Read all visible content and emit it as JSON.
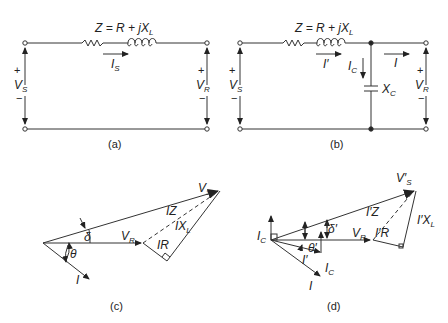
{
  "figure": {
    "panels": [
      {
        "id": "a",
        "caption": "(a)",
        "type": "circuit",
        "impedance_label": "Z = R + jX",
        "impedance_sub": "L",
        "current_label": "I",
        "current_sub": "S",
        "vs_label": "V",
        "vs_sub": "S",
        "vr_label": "V",
        "vr_sub": "R",
        "plus": "+",
        "minus": "−"
      },
      {
        "id": "b",
        "caption": "(b)",
        "type": "circuit",
        "impedance_label": "Z = R + jX",
        "impedance_sub": "L",
        "current_label": "I′",
        "cap_current_label": "I",
        "cap_current_sub": "C",
        "load_current_label": "I",
        "capacitor_label": "X",
        "capacitor_sub": "C",
        "vs_label": "V",
        "vs_sub": "S",
        "vr_label": "V",
        "vr_sub": "R",
        "plus": "+",
        "minus": "−"
      },
      {
        "id": "c",
        "caption": "(c)",
        "type": "phasor",
        "labels": {
          "vs": "V",
          "vs_sub": "S",
          "vr": "V",
          "vr_sub": "R",
          "iz": "IZ",
          "ixl": "IX",
          "ixl_sub": "L",
          "ir": "IR",
          "i": "I",
          "delta": "δ",
          "theta": "θ"
        }
      },
      {
        "id": "d",
        "caption": "(d)",
        "type": "phasor",
        "labels": {
          "vs": "V′",
          "vs_sub": "S",
          "vr": "V",
          "vr_sub": "R",
          "iz": "I′Z",
          "ixl": "I′X",
          "ixl_sub": "L",
          "ir": "I′R",
          "ic_top": "I",
          "ic_top_sub": "C",
          "ic": "I",
          "ic_sub": "C",
          "iprime": "I′",
          "i": "I",
          "delta": "δ′",
          "theta": "θ′"
        }
      }
    ]
  }
}
